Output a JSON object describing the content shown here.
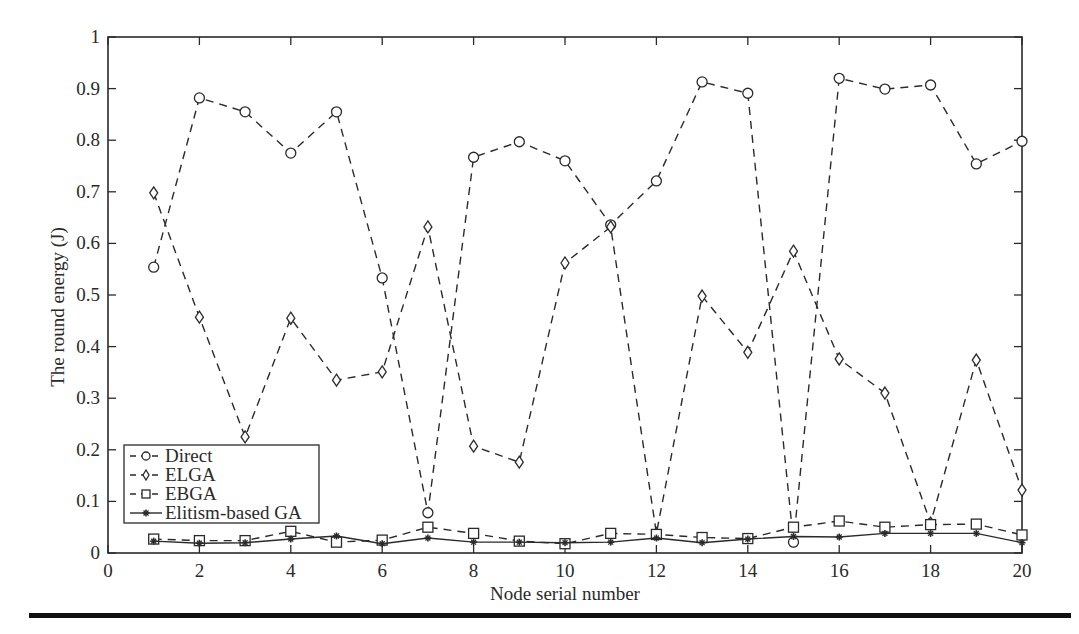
{
  "chart_data": {
    "type": "line",
    "title": "",
    "xlabel": "Node serial number",
    "ylabel": "The round energy (J)",
    "xlim": [
      0,
      20
    ],
    "ylim": [
      0,
      1
    ],
    "x_ticks": [
      0,
      2,
      4,
      6,
      8,
      10,
      12,
      14,
      16,
      18,
      20
    ],
    "y_ticks": [
      0,
      0.1,
      0.2,
      0.3,
      0.4,
      0.5,
      0.6,
      0.7,
      0.8,
      0.9,
      1
    ],
    "y_tick_labels": [
      "0",
      "0.1",
      "0.2",
      "0.3",
      "0.4",
      "0.5",
      "0.6",
      "0.7",
      "0.8",
      "0.9",
      "1"
    ],
    "grid": false,
    "legend_position": "lower left",
    "x": [
      1,
      2,
      3,
      4,
      5,
      6,
      7,
      8,
      9,
      10,
      11,
      12,
      13,
      14,
      15,
      16,
      17,
      18,
      19,
      20
    ],
    "series": [
      {
        "name": "Direct",
        "marker": "circle",
        "linestyle": "dashed",
        "values": [
          0.554,
          0.882,
          0.855,
          0.775,
          0.855,
          0.533,
          0.078,
          0.767,
          0.797,
          0.76,
          0.636,
          0.721,
          0.913,
          0.891,
          0.021,
          0.92,
          0.899,
          0.907,
          0.754,
          0.798
        ]
      },
      {
        "name": "ELGA",
        "marker": "diamond",
        "linestyle": "dashed",
        "values": [
          0.698,
          0.457,
          0.225,
          0.455,
          0.335,
          0.351,
          0.632,
          0.207,
          0.176,
          0.562,
          0.632,
          0.038,
          0.498,
          0.389,
          0.585,
          0.376,
          0.31,
          0.058,
          0.374,
          0.122
        ]
      },
      {
        "name": "EBGA",
        "marker": "square",
        "linestyle": "dashed",
        "values": [
          0.027,
          0.024,
          0.024,
          0.042,
          0.021,
          0.025,
          0.05,
          0.038,
          0.023,
          0.018,
          0.038,
          0.036,
          0.03,
          0.028,
          0.05,
          0.062,
          0.05,
          0.055,
          0.056,
          0.035
        ]
      },
      {
        "name": "Elitism-based GA",
        "marker": "star",
        "linestyle": "solid",
        "values": [
          0.023,
          0.019,
          0.02,
          0.027,
          0.033,
          0.018,
          0.029,
          0.021,
          0.021,
          0.02,
          0.021,
          0.029,
          0.02,
          0.027,
          0.032,
          0.031,
          0.038,
          0.038,
          0.038,
          0.02
        ]
      }
    ]
  },
  "plot": {
    "left": 108,
    "right": 1022,
    "top": 37,
    "bottom": 553,
    "line_color": "#2a2a2a"
  },
  "legend": {
    "items": [
      {
        "label": "Direct"
      },
      {
        "label": "ELGA"
      },
      {
        "label": "EBGA"
      },
      {
        "label": "Elitism-based GA"
      }
    ]
  }
}
